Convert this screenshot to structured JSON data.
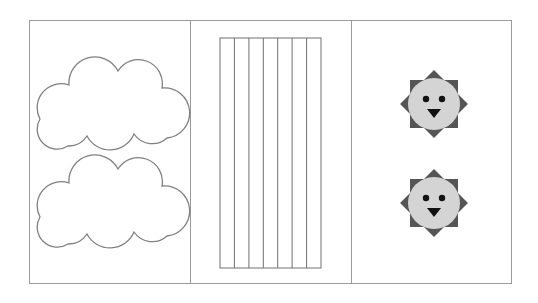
{
  "panels": [
    {
      "id": "clouds",
      "shape": "cloud",
      "count": 2,
      "stroke": "#808080",
      "fill": "#ffffff"
    },
    {
      "id": "stripes",
      "shape": "vertical-stripes",
      "columns": 7,
      "stroke": "#707070"
    },
    {
      "id": "suns",
      "shape": "sun-face",
      "count": 2,
      "face_color": "#d4d4d4",
      "ray_color": "#555555",
      "feature_color": "#111111"
    }
  ]
}
